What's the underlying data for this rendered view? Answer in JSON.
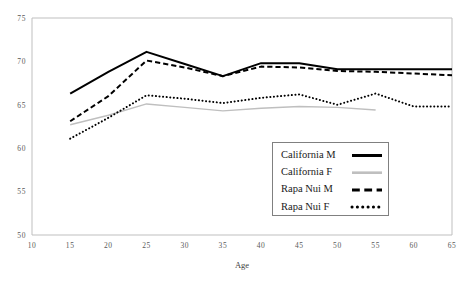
{
  "chart_data": {
    "type": "line",
    "title": "",
    "xlabel": "Age",
    "ylabel": "",
    "xlim": [
      10,
      65
    ],
    "ylim": [
      50,
      75
    ],
    "xticks": [
      10,
      15,
      20,
      25,
      30,
      35,
      40,
      45,
      50,
      55,
      60,
      65
    ],
    "yticks": [
      50,
      55,
      60,
      65,
      70,
      75
    ],
    "xtick_labels": [
      "10",
      "15",
      "20",
      "25",
      "30",
      "35",
      "40",
      "45",
      "50",
      "55",
      "60",
      "65"
    ],
    "ytick_labels": [
      "50",
      "55",
      "60",
      "65",
      "70",
      "75"
    ],
    "grid": false,
    "legend_position": "center-right-inside",
    "series": [
      {
        "name": "California M",
        "style": "solid",
        "color": "#000000",
        "width": 2.0,
        "x": [
          15,
          20,
          25,
          30,
          35,
          40,
          45,
          50,
          55,
          60,
          65
        ],
        "values": [
          66.3,
          68.8,
          71.1,
          69.7,
          68.3,
          69.8,
          69.8,
          69.1,
          69.1,
          69.1,
          69.1
        ]
      },
      {
        "name": "California F",
        "style": "solid",
        "color": "#bfbfbf",
        "width": 1.4,
        "x": [
          15,
          20,
          25,
          30,
          35,
          40,
          45,
          50,
          55
        ],
        "values": [
          62.7,
          63.8,
          65.1,
          64.7,
          64.3,
          64.6,
          64.8,
          64.7,
          64.4
        ]
      },
      {
        "name": "Rapa Nui M",
        "style": "dashed",
        "color": "#000000",
        "width": 2.0,
        "x": [
          15,
          20,
          25,
          30,
          35,
          40,
          45,
          50,
          55,
          60,
          65
        ],
        "values": [
          63.1,
          66.0,
          70.1,
          69.3,
          68.3,
          69.4,
          69.3,
          68.9,
          68.8,
          68.6,
          68.4
        ]
      },
      {
        "name": "Rapa Nui F",
        "style": "dotted",
        "color": "#000000",
        "width": 2.0,
        "x": [
          15,
          20,
          25,
          30,
          35,
          40,
          45,
          50,
          55,
          60,
          65
        ],
        "values": [
          61.1,
          63.5,
          66.1,
          65.7,
          65.2,
          65.8,
          66.2,
          65.0,
          66.3,
          64.8,
          64.8
        ]
      }
    ]
  },
  "legend": {
    "items": [
      {
        "label": "California M",
        "style": "solid",
        "color": "#000000"
      },
      {
        "label": "California F",
        "style": "solid",
        "color": "#bfbfbf"
      },
      {
        "label": "Rapa Nui M",
        "style": "dashed",
        "color": "#000000"
      },
      {
        "label": "Rapa Nui F",
        "style": "dotted",
        "color": "#000000"
      }
    ]
  },
  "axes": {
    "x_title": "Age"
  }
}
